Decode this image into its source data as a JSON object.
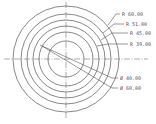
{
  "drawing": {
    "type": "concentric circles dimension drawing",
    "center": {
      "x": 66,
      "y": 59
    },
    "circles": [
      {
        "kind": "radius",
        "label": "R 60.00",
        "r_px": 53
      },
      {
        "kind": "radius",
        "label": "R 51.00",
        "r_px": 45
      },
      {
        "kind": "radius",
        "label": "R 45.00",
        "r_px": 39
      },
      {
        "kind": "radius",
        "label": "R 39.00",
        "r_px": 33
      },
      {
        "kind": "diameter",
        "label": "Ø 60.00",
        "r_px": 27
      },
      {
        "kind": "diameter",
        "label": "Ø 40.00",
        "r_px": 18
      }
    ],
    "labels": {
      "r60": "R 60.00",
      "r51": "R 51.00",
      "r45": "R 45.00",
      "r39": "R 39.00",
      "d40": "Ø 40.00",
      "d60": "Ø 60.00"
    },
    "colors": {
      "line": "#555555",
      "center_line": "#777777",
      "background": "#ffffff"
    }
  }
}
